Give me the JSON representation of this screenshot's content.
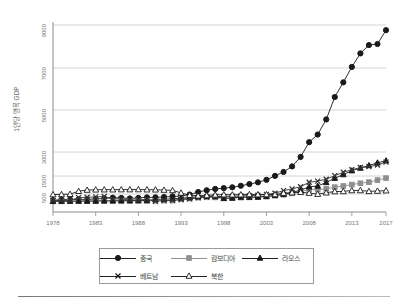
{
  "chart_data": {
    "type": "line",
    "title": "",
    "xlabel": "",
    "ylabel": "1인당 명목 GDP",
    "xtick_labels": [
      "1978",
      "1983",
      "1988",
      "1993",
      "1998",
      "2003",
      "2008",
      "2013",
      "2017"
    ],
    "ytick_labels": [
      "500",
      "1500",
      "3000",
      "5000",
      "7000",
      "9000"
    ],
    "ytick_values": [
      500,
      1500,
      3000,
      5000,
      7000,
      9000
    ],
    "xlim": [
      1978,
      2017
    ],
    "ylim": [
      0,
      9500
    ],
    "grid": "horizontal",
    "legend_position": "bottom",
    "x": [
      1978,
      1979,
      1980,
      1981,
      1982,
      1983,
      1984,
      1985,
      1986,
      1987,
      1988,
      1989,
      1990,
      1991,
      1992,
      1993,
      1994,
      1995,
      1996,
      1997,
      1998,
      1999,
      2000,
      2001,
      2002,
      2003,
      2004,
      2005,
      2006,
      2007,
      2008,
      2009,
      2010,
      2011,
      2012,
      2013,
      2014,
      2015,
      2016,
      2017
    ],
    "series": [
      {
        "name": "중국",
        "marker": "filled-circle",
        "color": "#1a1a1a",
        "values": [
          156,
          184,
          195,
          197,
          203,
          225,
          251,
          294,
          282,
          252,
          284,
          311,
          317,
          333,
          366,
          377,
          473,
          609,
          709,
          781,
          828,
          873,
          959,
          1053,
          1148,
          1288,
          1508,
          1753,
          2099,
          2694,
          3468,
          3832,
          4550,
          5618,
          6317,
          7051,
          7679,
          8067,
          8117,
          8759
        ]
      },
      {
        "name": "캄보디아",
        "marker": "filled-square",
        "color": "#8f8f8f",
        "values": [
          90,
          95,
          98,
          100,
          105,
          110,
          115,
          118,
          120,
          122,
          124,
          126,
          128,
          130,
          133,
          229,
          252,
          300,
          316,
          310,
          269,
          285,
          300,
          313,
          328,
          352,
          406,
          472,
          536,
          632,
          743,
          739,
          786,
          880,
          945,
          1026,
          1098,
          1160,
          1270,
          1385
        ]
      },
      {
        "name": "라오스",
        "marker": "filled-triangle",
        "color": "#1a1a1a",
        "values": [
          95,
          100,
          103,
          106,
          108,
          112,
          118,
          120,
          124,
          128,
          132,
          136,
          202,
          213,
          232,
          270,
          297,
          353,
          384,
          355,
          254,
          277,
          325,
          325,
          329,
          371,
          424,
          473,
          591,
          709,
          897,
          945,
          1141,
          1379,
          1589,
          1832,
          1995,
          2159,
          2324,
          2457
        ]
      },
      {
        "name": "베트남",
        "marker": "x-cross",
        "color": "#333333",
        "values": [
          130,
          135,
          140,
          300,
          320,
          340,
          360,
          230,
          230,
          160,
          180,
          200,
          95,
          138,
          144,
          185,
          228,
          288,
          337,
          361,
          361,
          374,
          390,
          405,
          432,
          478,
          546,
          687,
          784,
          906,
          1149,
          1217,
          1318,
          1525,
          1735,
          1887,
          2030,
          2085,
          2192,
          2366
        ]
      },
      {
        "name": "북한",
        "marker": "open-triangle",
        "color": "#1a1a1a",
        "values": [
          470,
          480,
          490,
          655,
          720,
          735,
          740,
          740,
          745,
          745,
          750,
          740,
          735,
          720,
          700,
          560,
          430,
          400,
          420,
          450,
          465,
          455,
          462,
          476,
          468,
          471,
          473,
          548,
          575,
          597,
          551,
          494,
          570,
          639,
          643,
          696,
          698,
          649,
          665,
          685
        ]
      }
    ]
  },
  "legend": {
    "rows": [
      [
        {
          "label": "중국",
          "marker": "filled-circle"
        },
        {
          "label": "캄보디아",
          "marker": "filled-square"
        },
        {
          "label": "라오스",
          "marker": "filled-triangle"
        }
      ],
      [
        {
          "label": "베트남",
          "marker": "x-cross"
        },
        {
          "label": "북한",
          "marker": "open-triangle"
        }
      ]
    ]
  }
}
